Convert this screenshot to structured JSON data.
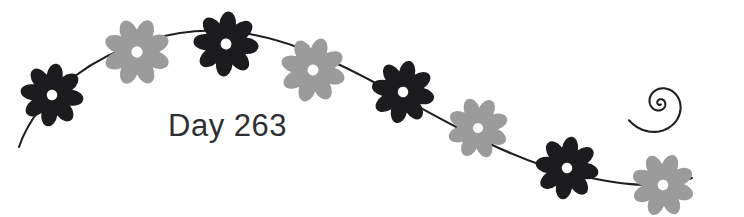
{
  "artwork": {
    "title": "Day 263 floral vine divider",
    "background_color": "#ffffff",
    "width": 744,
    "height": 217
  },
  "caption": {
    "label": "Day 263",
    "color": "#2f2f33",
    "x": 168,
    "y": 136,
    "font_size": 31
  },
  "vine": {
    "name": "flower-vine-stem",
    "color": "#1f1f22",
    "stroke_width": 2.1,
    "path": "M 19 147 C 28 120, 48 96, 75 76 C 112 48, 170 27, 226 31 C 282 35, 338 62, 392 92 C 448 123, 512 160, 572 174 C 620 185, 660 190, 692 178"
  },
  "spiral": {
    "name": "vine-spiral-tail",
    "color": "#1f1f22",
    "stroke_width": 2.1,
    "description": "inward counter-clockwise spiral terminating the vine at the right edge"
  },
  "flowers": [
    {
      "id": "flower-1",
      "color_name": "dark",
      "color": "#1c1c1f",
      "cx": 52,
      "cy": 95,
      "r": 31,
      "rotation": 8
    },
    {
      "id": "flower-2",
      "color_name": "light",
      "color": "#9b9b9b",
      "cx": 137,
      "cy": 52,
      "r": 33,
      "rotation": 22
    },
    {
      "id": "flower-3",
      "color_name": "dark",
      "color": "#1c1c1f",
      "cx": 226,
      "cy": 44,
      "r": 32,
      "rotation": 5
    },
    {
      "id": "flower-4",
      "color_name": "light",
      "color": "#9b9b9b",
      "cx": 313,
      "cy": 70,
      "r": 32,
      "rotation": 17
    },
    {
      "id": "flower-5",
      "color_name": "dark",
      "color": "#1c1c1f",
      "cx": 403,
      "cy": 92,
      "r": 31,
      "rotation": 12
    },
    {
      "id": "flower-6",
      "color_name": "light",
      "color": "#9b9b9b",
      "cx": 478,
      "cy": 128,
      "r": 30,
      "rotation": 26
    },
    {
      "id": "flower-7",
      "color_name": "dark",
      "color": "#1c1c1f",
      "cx": 567,
      "cy": 168,
      "r": 31,
      "rotation": 9
    },
    {
      "id": "flower-8",
      "color_name": "light",
      "color": "#9b9b9b",
      "cx": 663,
      "cy": 185,
      "r": 31,
      "rotation": 20
    }
  ],
  "flower_style": {
    "petal_count": 8,
    "center_color": "#ffffff",
    "center_radius_ratio": 0.17
  }
}
